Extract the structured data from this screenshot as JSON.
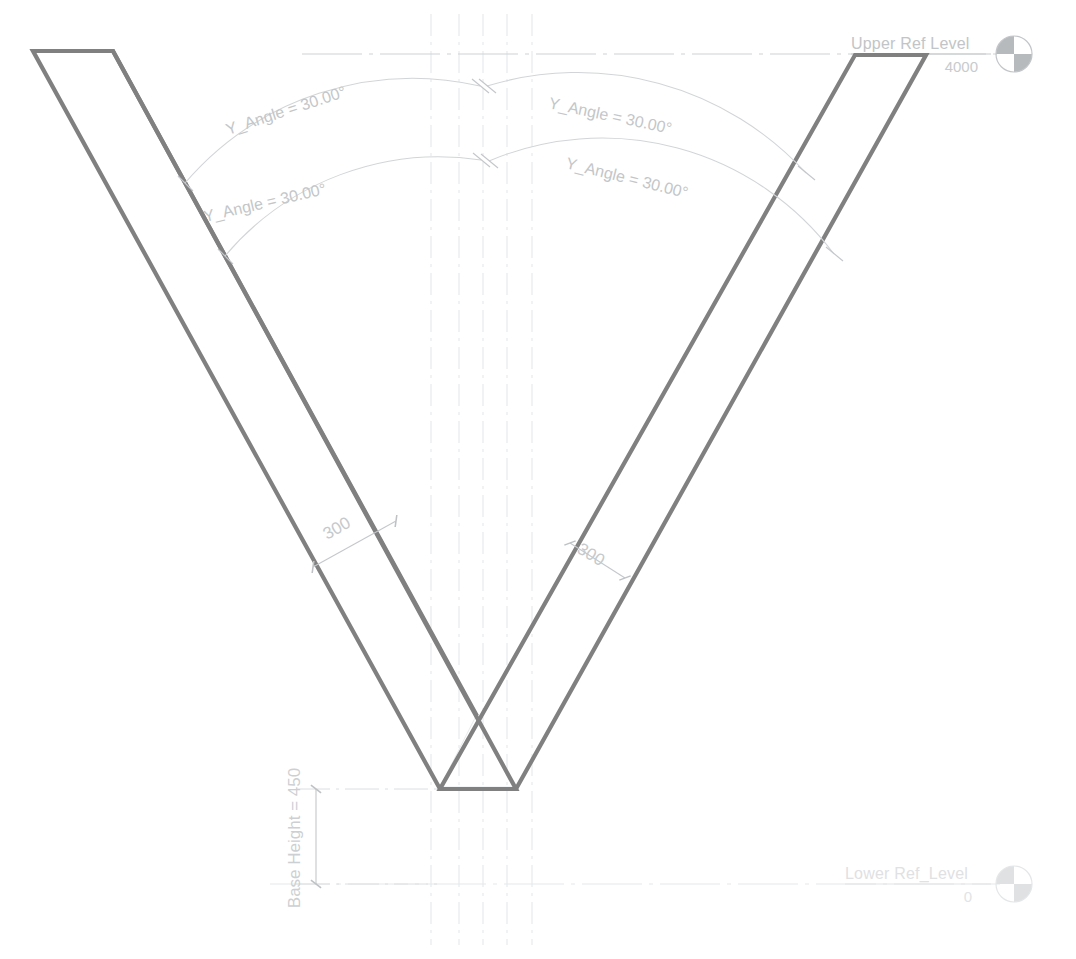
{
  "drawing": {
    "title": "Parametric V-Section Elevation",
    "background_color": "#ffffff",
    "outline_color": "#808080",
    "annotation_color": "#c3c6c8",
    "centerline_color": "#e6e8ea"
  },
  "levels": [
    {
      "id": "upper-ref-level",
      "name": "Upper Ref Level",
      "elevation": "4000",
      "marker": "half-filled-circle-icon"
    },
    {
      "id": "lower-ref-level",
      "name": "Lower Ref_Level",
      "elevation": "0",
      "marker": "half-filled-circle-icon"
    }
  ],
  "angle_dimensions": [
    {
      "id": "angle-left-outer",
      "label": "Y_Angle = 30.00°"
    },
    {
      "id": "angle-left-inner",
      "label": "Y_Angle = 30.00°"
    },
    {
      "id": "angle-right-outer",
      "label": "Y_Angle = 30.00°"
    },
    {
      "id": "angle-right-inner",
      "label": "Y_Angle = 30.00°"
    }
  ],
  "thickness_dimensions": [
    {
      "id": "thickness-left",
      "label": "300"
    },
    {
      "id": "thickness-right",
      "label": "300"
    }
  ],
  "linear_dimensions": [
    {
      "id": "base-height",
      "label": "Base Height = 450"
    }
  ]
}
